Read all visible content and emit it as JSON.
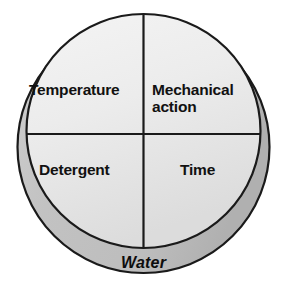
{
  "diagram": {
    "type": "quadrant-disc",
    "geometry": {
      "center_x": 143.5,
      "center_y": 147,
      "outer_radius": 126,
      "face_offset_y": -16,
      "divider_vertical_x": 143.5,
      "divider_horizontal_y": 134
    },
    "colors": {
      "face_light": "#f2f2f2",
      "face_mid": "#e6e6e6",
      "face_shadow": "#d8d8d8",
      "rim_light": "#dcdcdc",
      "rim_dark": "#b4b4b4",
      "outline": "#1a1a1a",
      "text": "#111111",
      "background": "#ffffff"
    },
    "quadrants": [
      {
        "position": "top-left",
        "label": "Temperature"
      },
      {
        "position": "top-right",
        "label": "Mechanical\naction"
      },
      {
        "position": "bottom-left",
        "label": "Detergent"
      },
      {
        "position": "bottom-right",
        "label": "Time"
      }
    ],
    "rim": {
      "label": "Water"
    }
  }
}
